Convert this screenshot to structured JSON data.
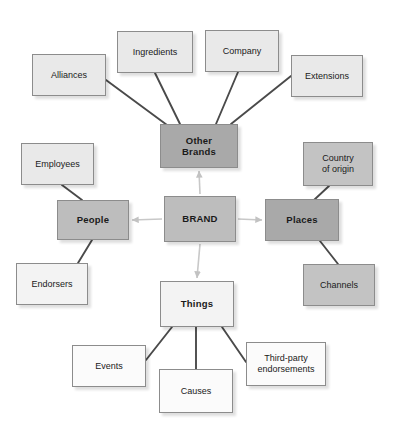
{
  "diagram": {
    "type": "hub-and-spoke concept map",
    "colors": {
      "hub_fill": "#bdbdbd",
      "category_dark_fill": "#a9a9a9",
      "category_mid_fill": "#bdbdbd",
      "category_pale_fill": "#f3f3f3",
      "leaf_light_fill": "#e9e9e9",
      "leaf_white_fill": "#fbfbfb",
      "border": "#8c8c8c",
      "spoke_line": "#4a4a4a",
      "hub_arrow": "#c8c8c8",
      "text": "#1a1a1a",
      "background": "#ffffff"
    },
    "hub": {
      "id": "brand",
      "label": "BRAND",
      "x": 164,
      "y": 196,
      "w": 72,
      "h": 46,
      "tone": "tone-mid",
      "style": "hub"
    },
    "categories": [
      {
        "id": "other-brands",
        "label": "Other\nBrands",
        "x": 160,
        "y": 124,
        "w": 78,
        "h": 44,
        "tone": "tone-dark",
        "style": "cat"
      },
      {
        "id": "people",
        "label": "People",
        "x": 57,
        "y": 200,
        "w": 72,
        "h": 40,
        "tone": "tone-mid",
        "style": "cat"
      },
      {
        "id": "places",
        "label": "Places",
        "x": 265,
        "y": 199,
        "w": 74,
        "h": 42,
        "tone": "tone-dark",
        "style": "cat"
      },
      {
        "id": "things",
        "label": "Things",
        "x": 160,
        "y": 281,
        "w": 74,
        "h": 46,
        "tone": "tone-pale",
        "style": "cat"
      }
    ],
    "leaves": [
      {
        "id": "alliances",
        "label": "Alliances",
        "x": 32,
        "y": 54,
        "w": 74,
        "h": 42,
        "tone": "tone-light",
        "parent": "other-brands"
      },
      {
        "id": "ingredients",
        "label": "Ingredients",
        "x": 117,
        "y": 31,
        "w": 76,
        "h": 42,
        "tone": "tone-light",
        "parent": "other-brands"
      },
      {
        "id": "company",
        "label": "Company",
        "x": 205,
        "y": 30,
        "w": 74,
        "h": 42,
        "tone": "tone-light",
        "parent": "other-brands"
      },
      {
        "id": "extensions",
        "label": "Extensions",
        "x": 291,
        "y": 55,
        "w": 72,
        "h": 42,
        "tone": "tone-light",
        "parent": "other-brands"
      },
      {
        "id": "employees",
        "label": "Employees",
        "x": 21,
        "y": 143,
        "w": 73,
        "h": 42,
        "tone": "tone-light",
        "parent": "people"
      },
      {
        "id": "endorsers",
        "label": "Endorsers",
        "x": 16,
        "y": 263,
        "w": 72,
        "h": 42,
        "tone": "tone-pale",
        "parent": "people"
      },
      {
        "id": "country-of-origin",
        "label": "Country\nof origin",
        "x": 303,
        "y": 142,
        "w": 70,
        "h": 44,
        "tone": "tone-mid2",
        "parent": "places"
      },
      {
        "id": "channels",
        "label": "Channels",
        "x": 303,
        "y": 264,
        "w": 72,
        "h": 42,
        "tone": "tone-mid2",
        "parent": "places"
      },
      {
        "id": "events",
        "label": "Events",
        "x": 72,
        "y": 345,
        "w": 74,
        "h": 42,
        "tone": "tone-white",
        "parent": "things"
      },
      {
        "id": "causes",
        "label": "Causes",
        "x": 159,
        "y": 369,
        "w": 74,
        "h": 44,
        "tone": "tone-white",
        "parent": "things"
      },
      {
        "id": "third-party-endorsements",
        "label": "Third-party\nendorsements",
        "x": 246,
        "y": 342,
        "w": 80,
        "h": 44,
        "tone": "tone-white",
        "parent": "things"
      }
    ],
    "spokes": [
      {
        "id": "spoke-alliances",
        "x1": 106,
        "y1": 80,
        "x2": 167,
        "y2": 125
      },
      {
        "id": "spoke-ingredients",
        "x1": 155,
        "y1": 73,
        "x2": 180,
        "y2": 124
      },
      {
        "id": "spoke-company",
        "x1": 238,
        "y1": 72,
        "x2": 216,
        "y2": 124
      },
      {
        "id": "spoke-extensions",
        "x1": 291,
        "y1": 76,
        "x2": 231,
        "y2": 124
      },
      {
        "id": "spoke-employees",
        "x1": 62,
        "y1": 185,
        "x2": 82,
        "y2": 200
      },
      {
        "id": "spoke-endorsers",
        "x1": 78,
        "y1": 263,
        "x2": 92,
        "y2": 240
      },
      {
        "id": "spoke-country",
        "x1": 329,
        "y1": 186,
        "x2": 314,
        "y2": 200
      },
      {
        "id": "spoke-channels",
        "x1": 338,
        "y1": 264,
        "x2": 320,
        "y2": 241
      },
      {
        "id": "spoke-events",
        "x1": 146,
        "y1": 360,
        "x2": 172,
        "y2": 327
      },
      {
        "id": "spoke-causes",
        "x1": 196,
        "y1": 369,
        "x2": 196,
        "y2": 327
      },
      {
        "id": "spoke-third-party",
        "x1": 246,
        "y1": 362,
        "x2": 222,
        "y2": 327
      }
    ],
    "hub_arrows": [
      {
        "id": "arrow-brand-to-other-brands",
        "from": "brand",
        "to": "other-brands",
        "direction": "up"
      },
      {
        "id": "arrow-brand-to-things",
        "from": "brand",
        "to": "things",
        "direction": "down"
      },
      {
        "id": "arrow-brand-to-people",
        "from": "brand",
        "to": "people",
        "direction": "left"
      },
      {
        "id": "arrow-brand-to-places",
        "from": "brand",
        "to": "places",
        "direction": "right"
      }
    ]
  }
}
